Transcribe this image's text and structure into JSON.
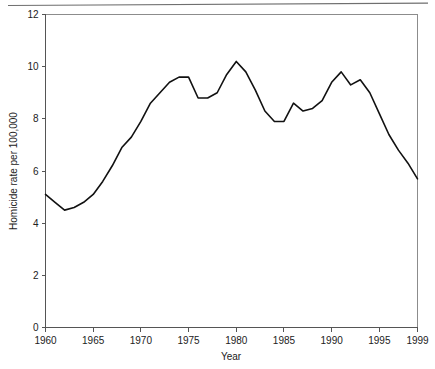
{
  "chart_data": {
    "type": "line",
    "title": "",
    "subtitle": "",
    "xlabel": "Year",
    "ylabel": "Homicide rate per 100,000",
    "xlim": [
      1960,
      1999
    ],
    "ylim": [
      0,
      12
    ],
    "grid": false,
    "legend": "none",
    "line_color": "#111111",
    "frame_color": "#8c8c8c",
    "xticks": [
      1960,
      1965,
      1970,
      1975,
      1980,
      1985,
      1990,
      1995,
      1999
    ],
    "xtick_labels": [
      "1960",
      "1965",
      "1970",
      "1975",
      "1980",
      "1985",
      "1990",
      "1995",
      "1999"
    ],
    "yticks": [
      0,
      2,
      4,
      6,
      8,
      10,
      12
    ],
    "ytick_labels": [
      "0",
      "2",
      "4",
      "6",
      "8",
      "10",
      "12"
    ],
    "series": [
      {
        "name": "Homicide rate",
        "x": [
          1960,
          1961,
          1962,
          1963,
          1964,
          1965,
          1966,
          1967,
          1968,
          1969,
          1970,
          1971,
          1972,
          1973,
          1974,
          1975,
          1976,
          1977,
          1978,
          1979,
          1980,
          1981,
          1982,
          1983,
          1984,
          1985,
          1986,
          1987,
          1988,
          1989,
          1990,
          1991,
          1992,
          1993,
          1994,
          1995,
          1996,
          1997,
          1998,
          1999
        ],
        "values": [
          5.1,
          4.8,
          4.5,
          4.6,
          4.8,
          5.1,
          5.6,
          6.2,
          6.9,
          7.3,
          7.9,
          8.6,
          9.0,
          9.4,
          9.6,
          9.6,
          8.8,
          8.8,
          9.0,
          9.7,
          10.2,
          9.8,
          9.1,
          8.3,
          7.9,
          7.9,
          8.6,
          8.3,
          8.4,
          8.7,
          9.4,
          9.8,
          9.3,
          9.5,
          9.0,
          8.2,
          7.4,
          6.8,
          6.3,
          5.7
        ]
      }
    ]
  },
  "figure": {
    "top_rule_name": "scan-rule",
    "plot_background": "#ffffff"
  }
}
